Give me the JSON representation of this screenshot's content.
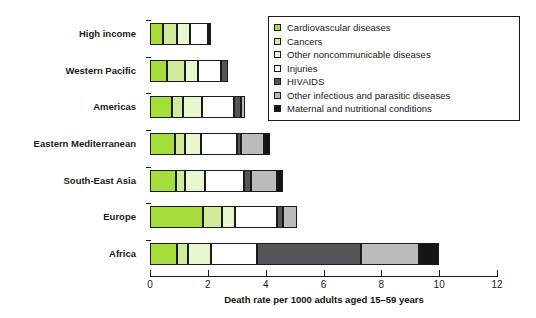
{
  "chart_data": {
    "type": "bar",
    "orientation": "horizontal",
    "stacked": true,
    "title": "",
    "xlabel": "Death rate per 1000 adults aged 15–59 years",
    "ylabel": "",
    "xlim": [
      0,
      12
    ],
    "xticks": [
      0,
      2,
      4,
      6,
      8,
      10,
      12
    ],
    "xtick_labels": [
      "0",
      "2",
      "4",
      "6",
      "8",
      "10",
      "12"
    ],
    "grid": false,
    "legend_position": "top-right",
    "categories": [
      "High income",
      "Western Pacific",
      "Americas",
      "Eastern Mediterranean",
      "South-East Asia",
      "Europe",
      "Africa"
    ],
    "series": [
      {
        "name": "Cardiovascular diseases",
        "color": "#a5dd3c",
        "values": [
          0.45,
          0.6,
          0.75,
          0.85,
          0.9,
          1.85,
          0.95
        ]
      },
      {
        "name": "Cancers",
        "color": "#cfeb9b",
        "values": [
          0.5,
          0.6,
          0.4,
          0.35,
          0.3,
          0.65,
          0.35
        ]
      },
      {
        "name": "Other noncommunicable diseases",
        "color": "#e9f6cf",
        "values": [
          0.45,
          0.45,
          0.65,
          0.55,
          0.7,
          0.45,
          0.8
        ]
      },
      {
        "name": "Injuries",
        "color": "#ffffff",
        "values": [
          0.6,
          0.8,
          1.1,
          1.25,
          1.35,
          1.45,
          1.6
        ]
      },
      {
        "name": "HIVAIDS",
        "color": "#55565a",
        "values": [
          0.05,
          0.25,
          0.25,
          0.15,
          0.25,
          0.2,
          3.6
        ]
      },
      {
        "name": "Other infectious and parasitic diseases",
        "color": "#b9bbbd",
        "values": [
          0.05,
          0.0,
          0.15,
          0.8,
          0.9,
          0.5,
          2.0
        ]
      },
      {
        "name": "Maternal and nutritional conditions",
        "color": "#151515",
        "values": [
          0.0,
          0.0,
          0.0,
          0.2,
          0.2,
          0.0,
          0.7
        ]
      }
    ],
    "totals": [
      2.1,
      2.7,
      3.3,
      4.15,
      4.6,
      5.1,
      10.0
    ]
  }
}
